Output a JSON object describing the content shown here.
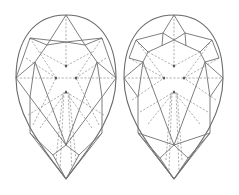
{
  "figure": {
    "width": 239,
    "height": 195,
    "colors": {
      "background": "#ffffff",
      "crown_line": "#707070",
      "pavilion_dash": "#8c8c8c",
      "outline": "#6a6a6a"
    }
  },
  "diagrams": [
    {
      "name": "pear-diagram-left",
      "offset_x": 0,
      "outline": {
        "top": [
          66,
          15
        ],
        "left": [
          16,
          78
        ],
        "right": [
          116,
          78
        ],
        "tip": [
          66,
          179
        ]
      },
      "solid_lines": [
        [
          [
            66,
            15
          ],
          [
            47,
            45
          ]
        ],
        [
          [
            66,
            15
          ],
          [
            85,
            45
          ]
        ],
        [
          [
            30,
            38
          ],
          [
            47,
            45
          ]
        ],
        [
          [
            102,
            38
          ],
          [
            85,
            45
          ]
        ],
        [
          [
            30,
            38
          ],
          [
            66,
            42
          ]
        ],
        [
          [
            102,
            38
          ],
          [
            66,
            42
          ]
        ],
        [
          [
            47,
            45
          ],
          [
            66,
            42
          ]
        ],
        [
          [
            85,
            45
          ],
          [
            66,
            42
          ]
        ],
        [
          [
            30,
            38
          ],
          [
            16,
            78
          ]
        ],
        [
          [
            102,
            38
          ],
          [
            116,
            78
          ]
        ],
        [
          [
            47,
            45
          ],
          [
            35,
            62
          ]
        ],
        [
          [
            85,
            45
          ],
          [
            97,
            62
          ]
        ],
        [
          [
            16,
            78
          ],
          [
            35,
            62
          ]
        ],
        [
          [
            116,
            78
          ],
          [
            97,
            62
          ]
        ],
        [
          [
            16,
            78
          ],
          [
            30,
            97
          ]
        ],
        [
          [
            116,
            78
          ],
          [
            102,
            97
          ]
        ],
        [
          [
            35,
            62
          ],
          [
            30,
            97
          ]
        ],
        [
          [
            97,
            62
          ],
          [
            102,
            97
          ]
        ],
        [
          [
            30,
            97
          ],
          [
            30,
            133
          ]
        ],
        [
          [
            102,
            97
          ],
          [
            102,
            133
          ]
        ],
        [
          [
            30,
            97
          ],
          [
            66,
            145
          ]
        ],
        [
          [
            102,
            97
          ],
          [
            66,
            145
          ]
        ],
        [
          [
            35,
            62
          ],
          [
            66,
            145
          ]
        ],
        [
          [
            97,
            62
          ],
          [
            66,
            145
          ]
        ],
        [
          [
            30,
            133
          ],
          [
            53,
            155
          ]
        ],
        [
          [
            102,
            133
          ],
          [
            79,
            155
          ]
        ],
        [
          [
            53,
            155
          ],
          [
            66,
            145
          ]
        ],
        [
          [
            79,
            155
          ],
          [
            66,
            145
          ]
        ],
        [
          [
            53,
            155
          ],
          [
            66,
            179
          ]
        ],
        [
          [
            79,
            155
          ],
          [
            66,
            179
          ]
        ],
        [
          [
            30,
            133
          ],
          [
            66,
            179
          ]
        ],
        [
          [
            102,
            133
          ],
          [
            66,
            179
          ]
        ]
      ],
      "dashed_lines": [
        [
          [
            66,
            15
          ],
          [
            66,
            66
          ]
        ],
        [
          [
            16,
            78
          ],
          [
            116,
            78
          ]
        ],
        [
          [
            30,
            38
          ],
          [
            56,
            78
          ]
        ],
        [
          [
            102,
            38
          ],
          [
            76,
            78
          ]
        ],
        [
          [
            40,
            52
          ],
          [
            66,
            66
          ]
        ],
        [
          [
            92,
            52
          ],
          [
            66,
            66
          ]
        ],
        [
          [
            26,
            58
          ],
          [
            56,
            78
          ]
        ],
        [
          [
            106,
            58
          ],
          [
            76,
            78
          ]
        ],
        [
          [
            28,
            115
          ],
          [
            66,
            92
          ]
        ],
        [
          [
            104,
            115
          ],
          [
            66,
            92
          ]
        ],
        [
          [
            40,
            128
          ],
          [
            66,
            92
          ]
        ],
        [
          [
            92,
            128
          ],
          [
            66,
            92
          ]
        ],
        [
          [
            56,
            160
          ],
          [
            63,
            92
          ]
        ],
        [
          [
            76,
            160
          ],
          [
            69,
            92
          ]
        ],
        [
          [
            60,
            170
          ],
          [
            64,
            92
          ]
        ],
        [
          [
            72,
            170
          ],
          [
            68,
            92
          ]
        ],
        [
          [
            33,
            125
          ],
          [
            56,
            78
          ]
        ],
        [
          [
            99,
            125
          ],
          [
            76,
            78
          ]
        ]
      ],
      "dots": [
        [
          66,
          66
        ],
        [
          56,
          78
        ],
        [
          76,
          78
        ],
        [
          66,
          92
        ]
      ]
    },
    {
      "name": "pear-diagram-right",
      "offset_x": 108,
      "outline": {
        "top": [
          66,
          15
        ],
        "left": [
          16,
          78
        ],
        "right": [
          115,
          78
        ],
        "tip": [
          66,
          179
        ]
      },
      "solid_lines": [
        [
          [
            66,
            15
          ],
          [
            55,
            33
          ]
        ],
        [
          [
            66,
            15
          ],
          [
            77,
            33
          ]
        ],
        [
          [
            28,
            40
          ],
          [
            55,
            33
          ]
        ],
        [
          [
            104,
            40
          ],
          [
            77,
            33
          ]
        ],
        [
          [
            55,
            33
          ],
          [
            66,
            40
          ]
        ],
        [
          [
            77,
            33
          ],
          [
            66,
            40
          ]
        ],
        [
          [
            28,
            40
          ],
          [
            40,
            52
          ]
        ],
        [
          [
            104,
            40
          ],
          [
            92,
            52
          ]
        ],
        [
          [
            40,
            52
          ],
          [
            66,
            40
          ]
        ],
        [
          [
            92,
            52
          ],
          [
            66,
            40
          ]
        ],
        [
          [
            55,
            33
          ],
          [
            54,
            46
          ]
        ],
        [
          [
            77,
            33
          ],
          [
            78,
            46
          ]
        ],
        [
          [
            21,
            58
          ],
          [
            28,
            40
          ]
        ],
        [
          [
            111,
            58
          ],
          [
            104,
            40
          ]
        ],
        [
          [
            21,
            58
          ],
          [
            35,
            62
          ]
        ],
        [
          [
            111,
            58
          ],
          [
            97,
            62
          ]
        ],
        [
          [
            40,
            52
          ],
          [
            35,
            62
          ]
        ],
        [
          [
            92,
            52
          ],
          [
            97,
            62
          ]
        ],
        [
          [
            16,
            78
          ],
          [
            35,
            62
          ]
        ],
        [
          [
            115,
            78
          ],
          [
            97,
            62
          ]
        ],
        [
          [
            16,
            78
          ],
          [
            30,
            97
          ]
        ],
        [
          [
            115,
            78
          ],
          [
            102,
            97
          ]
        ],
        [
          [
            35,
            62
          ],
          [
            30,
            97
          ]
        ],
        [
          [
            97,
            62
          ],
          [
            102,
            97
          ]
        ],
        [
          [
            30,
            97
          ],
          [
            30,
            133
          ]
        ],
        [
          [
            102,
            97
          ],
          [
            102,
            133
          ]
        ],
        [
          [
            35,
            62
          ],
          [
            66,
            145
          ]
        ],
        [
          [
            97,
            62
          ],
          [
            66,
            145
          ]
        ],
        [
          [
            30,
            133
          ],
          [
            66,
            145
          ]
        ],
        [
          [
            102,
            133
          ],
          [
            66,
            145
          ]
        ],
        [
          [
            30,
            133
          ],
          [
            52,
            158
          ]
        ],
        [
          [
            102,
            133
          ],
          [
            80,
            158
          ]
        ],
        [
          [
            52,
            158
          ],
          [
            66,
            145
          ]
        ],
        [
          [
            80,
            158
          ],
          [
            66,
            145
          ]
        ],
        [
          [
            52,
            158
          ],
          [
            66,
            179
          ]
        ],
        [
          [
            80,
            158
          ],
          [
            66,
            179
          ]
        ],
        [
          [
            30,
            133
          ],
          [
            66,
            179
          ]
        ],
        [
          [
            102,
            133
          ],
          [
            66,
            179
          ]
        ]
      ],
      "dashed_lines": [
        [
          [
            66,
            15
          ],
          [
            66,
            66
          ]
        ],
        [
          [
            16,
            78
          ],
          [
            115,
            78
          ]
        ],
        [
          [
            28,
            40
          ],
          [
            56,
            78
          ]
        ],
        [
          [
            104,
            40
          ],
          [
            76,
            78
          ]
        ],
        [
          [
            40,
            52
          ],
          [
            66,
            66
          ]
        ],
        [
          [
            92,
            52
          ],
          [
            66,
            66
          ]
        ],
        [
          [
            21,
            58
          ],
          [
            56,
            78
          ]
        ],
        [
          [
            111,
            58
          ],
          [
            76,
            78
          ]
        ],
        [
          [
            24,
            100
          ],
          [
            56,
            78
          ]
        ],
        [
          [
            108,
            100
          ],
          [
            76,
            78
          ]
        ],
        [
          [
            32,
            112
          ],
          [
            66,
            92
          ]
        ],
        [
          [
            100,
            112
          ],
          [
            66,
            92
          ]
        ],
        [
          [
            40,
            124
          ],
          [
            66,
            92
          ]
        ],
        [
          [
            92,
            124
          ],
          [
            66,
            92
          ]
        ],
        [
          [
            58,
            160
          ],
          [
            63,
            92
          ]
        ],
        [
          [
            74,
            160
          ],
          [
            69,
            92
          ]
        ],
        [
          [
            61,
            170
          ],
          [
            64,
            92
          ]
        ],
        [
          [
            71,
            170
          ],
          [
            68,
            92
          ]
        ]
      ],
      "dots": [
        [
          66,
          66
        ],
        [
          56,
          78
        ],
        [
          76,
          78
        ],
        [
          66,
          92
        ]
      ]
    }
  ]
}
